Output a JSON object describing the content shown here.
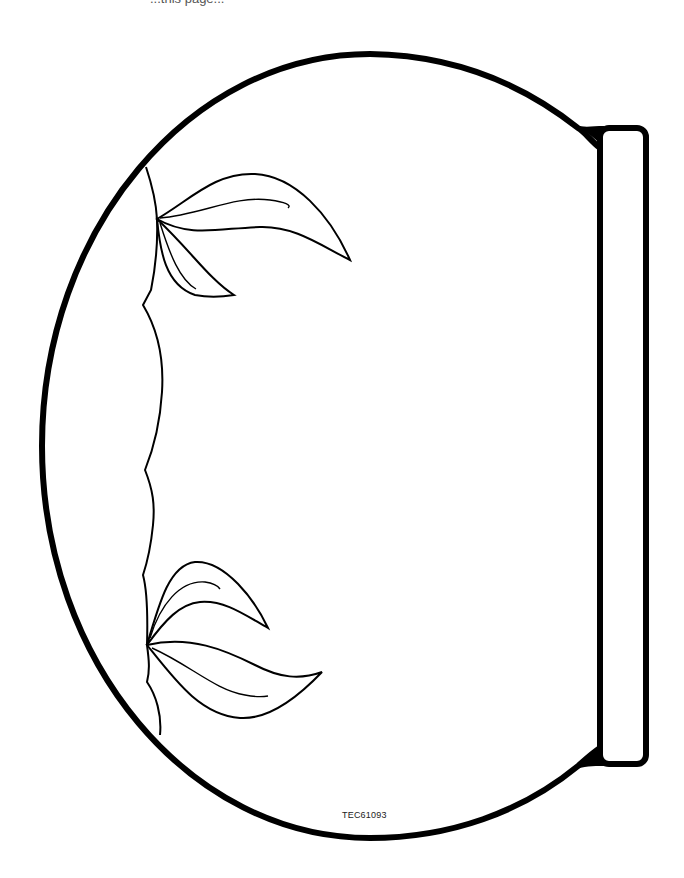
{
  "page": {
    "top_clipped_text": "...this page...",
    "product_code": "TEC61093"
  },
  "illustration": {
    "subject": "fishbowl outline with seaweed plants",
    "stroke_color": "#000000",
    "background_color": "#ffffff",
    "parts": [
      "bowl-outline",
      "bowl-rim",
      "seaweed-divider",
      "upper-plant",
      "lower-plant"
    ]
  }
}
